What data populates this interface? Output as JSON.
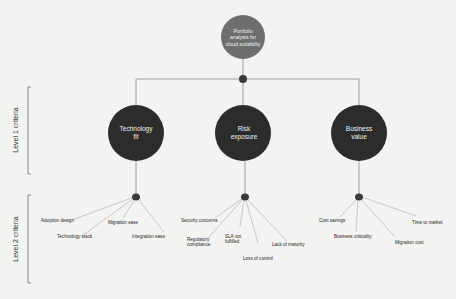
{
  "colors": {
    "background": "#f3f3f2",
    "root_node": "#6e6e6e",
    "level1_node": "#2c2c2c",
    "junction": "#3a3a3a",
    "line": "#9a9a9a",
    "bracket": "#7a7a7a"
  },
  "root": {
    "label": "Portfolio\nanalysis for\ncloud suitability"
  },
  "levels": [
    {
      "label": "Level 1 criteria"
    },
    {
      "label": "Level 2 criteria"
    }
  ],
  "level1": [
    {
      "label": "Technology\nfit",
      "criteria": [
        "Adoption design",
        "Technology stack",
        "Migration ease",
        "Integration ease"
      ]
    },
    {
      "label": "Risk\nexposure",
      "criteria": [
        "Security concerns",
        "Regulatory\ncompliance",
        "SLA not\nfulfilled",
        "Loss of control",
        "Lack of maturity"
      ]
    },
    {
      "label": "Business\nvalue",
      "criteria": [
        "Cost savings",
        "Business criticality",
        "Migration cost",
        "Time to market"
      ]
    }
  ]
}
